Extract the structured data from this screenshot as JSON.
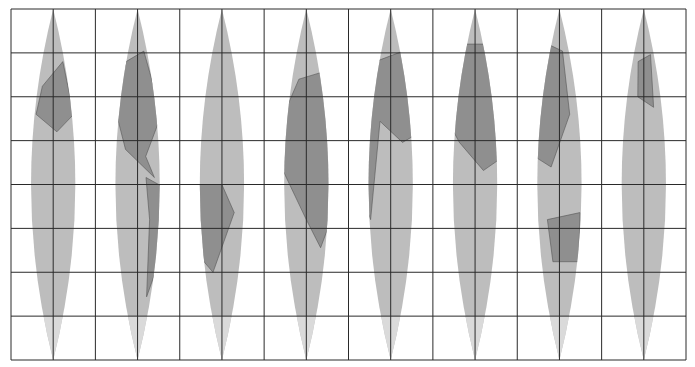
{
  "map": {
    "title": "Interrupted sinusoidal-style gore world map",
    "projection": "gores",
    "gore_count": 8,
    "bounds": {
      "left": 11,
      "top": 9,
      "right": 686,
      "bottom": 360
    },
    "grid": {
      "columns": 16,
      "rows": 8,
      "line_color": "#2a2a2a"
    },
    "colors": {
      "background": "#ffffff",
      "ocean": "#bdbdbd",
      "land": "#8f8f8f",
      "ice": "#dadada",
      "coast": "#555555"
    },
    "gores": [
      {
        "index": 0,
        "label": "Pacific (East)"
      },
      {
        "index": 1,
        "label": "North America"
      },
      {
        "index": 2,
        "label": "South America / Atlantic"
      },
      {
        "index": 3,
        "label": "Africa / Europe"
      },
      {
        "index": 4,
        "label": "Middle East / Indian Ocean"
      },
      {
        "index": 5,
        "label": "Asia"
      },
      {
        "index": 6,
        "label": "East Asia / Australia"
      },
      {
        "index": 7,
        "label": "Pacific (West)"
      }
    ]
  }
}
